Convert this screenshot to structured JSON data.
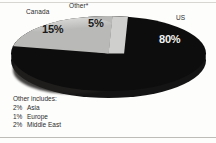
{
  "chart_data": {
    "type": "pie",
    "title": "",
    "subtitle": "",
    "xlabel": "",
    "ylabel": "",
    "legend_position": "callout-labels",
    "grid": false,
    "style": "3d-pie",
    "categories": [
      "US",
      "Canada",
      "Other*"
    ],
    "values": [
      80,
      15,
      5
    ],
    "value_labels": [
      "80%",
      "15%",
      "5%"
    ],
    "colors": [
      "#0d0d0d",
      "#b9b9b7",
      "#cfcfcd"
    ],
    "slices": [
      {
        "label": "US",
        "value": 80,
        "value_label": "80%",
        "color": "#0d0d0d"
      },
      {
        "label": "Canada",
        "value": 15,
        "value_label": "15%",
        "color": "#b9b9b7"
      },
      {
        "label": "Other*",
        "value": 5,
        "value_label": "5%",
        "color": "#cfcfcd"
      }
    ],
    "annotations": {
      "footnote_title": "Other includes:",
      "footnote_items": [
        {
          "percent": "2%",
          "name": "Asia"
        },
        {
          "percent": "1%",
          "name": "Europe"
        },
        {
          "percent": "2%",
          "name": "Middle East"
        }
      ]
    }
  },
  "labels": {
    "us": "US",
    "canada": "Canada",
    "other": "Other*"
  },
  "values": {
    "us": "80%",
    "canada": "15%",
    "other": "5%"
  },
  "footnote": {
    "title": "Other includes:",
    "rows": [
      {
        "percent": "2%",
        "name": "Asia"
      },
      {
        "percent": "1%",
        "name": "Europe"
      },
      {
        "percent": "2%",
        "name": "Middle East"
      }
    ]
  }
}
